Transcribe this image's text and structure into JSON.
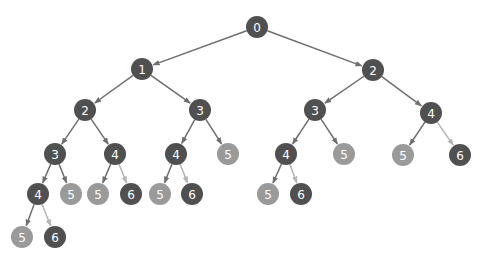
{
  "diagram": {
    "type": "tree",
    "colors": {
      "dark_node": "#505050",
      "light_node": "#9a9a9a",
      "edge": "#6e6e6e",
      "light_edge": "#b4b4b4",
      "label": "#ffffff"
    },
    "node_radius": 11,
    "nodes": [
      {
        "id": "n0",
        "label": "0",
        "x": 257,
        "y": 27,
        "shade": "dark"
      },
      {
        "id": "n1",
        "label": "1",
        "x": 142,
        "y": 69,
        "shade": "dark"
      },
      {
        "id": "n2",
        "label": "2",
        "x": 373,
        "y": 70,
        "shade": "dark"
      },
      {
        "id": "n3",
        "label": "2",
        "x": 85,
        "y": 110,
        "shade": "dark"
      },
      {
        "id": "n4",
        "label": "3",
        "x": 200,
        "y": 110,
        "shade": "dark"
      },
      {
        "id": "n5",
        "label": "3",
        "x": 315,
        "y": 110,
        "shade": "dark"
      },
      {
        "id": "n6",
        "label": "4",
        "x": 431,
        "y": 113,
        "shade": "dark"
      },
      {
        "id": "n7",
        "label": "3",
        "x": 55,
        "y": 154,
        "shade": "dark"
      },
      {
        "id": "n8",
        "label": "4",
        "x": 115,
        "y": 154,
        "shade": "dark"
      },
      {
        "id": "n9",
        "label": "4",
        "x": 176,
        "y": 154,
        "shade": "dark"
      },
      {
        "id": "n10",
        "label": "5",
        "x": 228,
        "y": 154,
        "shade": "light"
      },
      {
        "id": "n11",
        "label": "4",
        "x": 286,
        "y": 154,
        "shade": "dark"
      },
      {
        "id": "n12",
        "label": "5",
        "x": 344,
        "y": 154,
        "shade": "light"
      },
      {
        "id": "n13",
        "label": "5",
        "x": 403,
        "y": 155,
        "shade": "light"
      },
      {
        "id": "n14",
        "label": "6",
        "x": 460,
        "y": 155,
        "shade": "dark"
      },
      {
        "id": "n15",
        "label": "4",
        "x": 38,
        "y": 194,
        "shade": "dark"
      },
      {
        "id": "n16",
        "label": "5",
        "x": 71,
        "y": 194,
        "shade": "light"
      },
      {
        "id": "n17",
        "label": "5",
        "x": 98,
        "y": 194,
        "shade": "light"
      },
      {
        "id": "n18",
        "label": "6",
        "x": 131,
        "y": 194,
        "shade": "dark"
      },
      {
        "id": "n19",
        "label": "5",
        "x": 160,
        "y": 194,
        "shade": "light"
      },
      {
        "id": "n20",
        "label": "6",
        "x": 192,
        "y": 194,
        "shade": "dark"
      },
      {
        "id": "n21",
        "label": "5",
        "x": 268,
        "y": 194,
        "shade": "light"
      },
      {
        "id": "n22",
        "label": "6",
        "x": 301,
        "y": 194,
        "shade": "dark"
      },
      {
        "id": "n23",
        "label": "5",
        "x": 22,
        "y": 237,
        "shade": "light"
      },
      {
        "id": "n24",
        "label": "6",
        "x": 55,
        "y": 237,
        "shade": "dark"
      }
    ],
    "edges": [
      {
        "from": "n0",
        "to": "n1",
        "shade": "dark"
      },
      {
        "from": "n0",
        "to": "n2",
        "shade": "dark"
      },
      {
        "from": "n1",
        "to": "n3",
        "shade": "dark"
      },
      {
        "from": "n1",
        "to": "n4",
        "shade": "dark"
      },
      {
        "from": "n2",
        "to": "n5",
        "shade": "dark"
      },
      {
        "from": "n2",
        "to": "n6",
        "shade": "dark"
      },
      {
        "from": "n3",
        "to": "n7",
        "shade": "dark"
      },
      {
        "from": "n3",
        "to": "n8",
        "shade": "dark"
      },
      {
        "from": "n4",
        "to": "n9",
        "shade": "dark"
      },
      {
        "from": "n4",
        "to": "n10",
        "shade": "dark"
      },
      {
        "from": "n5",
        "to": "n11",
        "shade": "dark"
      },
      {
        "from": "n5",
        "to": "n12",
        "shade": "dark"
      },
      {
        "from": "n6",
        "to": "n13",
        "shade": "dark"
      },
      {
        "from": "n6",
        "to": "n14",
        "shade": "light"
      },
      {
        "from": "n7",
        "to": "n15",
        "shade": "dark"
      },
      {
        "from": "n7",
        "to": "n16",
        "shade": "dark"
      },
      {
        "from": "n8",
        "to": "n17",
        "shade": "dark"
      },
      {
        "from": "n8",
        "to": "n18",
        "shade": "light"
      },
      {
        "from": "n9",
        "to": "n19",
        "shade": "dark"
      },
      {
        "from": "n9",
        "to": "n20",
        "shade": "light"
      },
      {
        "from": "n11",
        "to": "n21",
        "shade": "dark"
      },
      {
        "from": "n11",
        "to": "n22",
        "shade": "light"
      },
      {
        "from": "n15",
        "to": "n23",
        "shade": "dark"
      },
      {
        "from": "n15",
        "to": "n24",
        "shade": "light"
      }
    ]
  }
}
